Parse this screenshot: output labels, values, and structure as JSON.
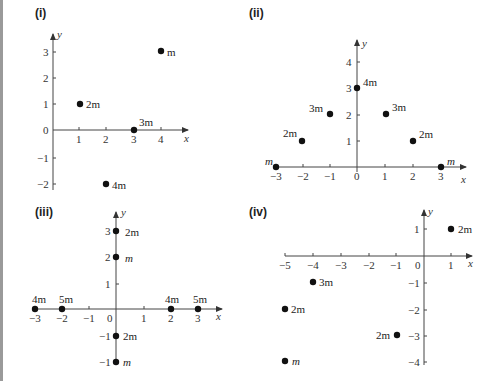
{
  "panels": [
    {
      "label": "(i)",
      "x_axis": "x",
      "y_axis": "y",
      "x_ticks": [
        "1",
        "2",
        "3",
        "4"
      ],
      "y_ticks": [
        "3",
        "2",
        "1",
        "0",
        "−1",
        "−2"
      ],
      "points": [
        {
          "x": 4,
          "y": 3,
          "mass": "m"
        },
        {
          "x": 1,
          "y": 1,
          "mass": "2m"
        },
        {
          "x": 3,
          "y": 0,
          "mass": "3m"
        },
        {
          "x": 2,
          "y": -2,
          "mass": "4m"
        }
      ]
    },
    {
      "label": "(ii)",
      "x_axis": "x",
      "y_axis": "y",
      "x_ticks": [
        "−3",
        "−2",
        "−1",
        "0",
        "1",
        "2",
        "3"
      ],
      "y_ticks": [
        "4",
        "3",
        "2",
        "1"
      ],
      "points": [
        {
          "x": -3,
          "y": 0,
          "mass": "m"
        },
        {
          "x": -2,
          "y": 1,
          "mass": "2m"
        },
        {
          "x": -1,
          "y": 2,
          "mass": "3m"
        },
        {
          "x": 0,
          "y": 3,
          "mass": "4m"
        },
        {
          "x": 1,
          "y": 2,
          "mass": "3m"
        },
        {
          "x": 2,
          "y": 1,
          "mass": "2m"
        },
        {
          "x": 3,
          "y": 0,
          "mass": "m"
        }
      ]
    },
    {
      "label": "(iii)",
      "x_axis": "x",
      "y_axis": "y",
      "x_ticks": [
        "−3",
        "−2",
        "−1",
        "0",
        "1",
        "2",
        "3"
      ],
      "y_ticks": [
        "3",
        "2",
        "1",
        "−1",
        "−1"
      ],
      "points": [
        {
          "x": 0,
          "y": 3,
          "mass": "2m"
        },
        {
          "x": 0,
          "y": 2,
          "mass": "m"
        },
        {
          "x": -3,
          "y": 0,
          "mass": "4m"
        },
        {
          "x": -2,
          "y": 0,
          "mass": "5m"
        },
        {
          "x": 2,
          "y": 0,
          "mass": "4m"
        },
        {
          "x": 3,
          "y": 0,
          "mass": "5m"
        },
        {
          "x": 0,
          "y": -1,
          "mass": "2m"
        },
        {
          "x": 0,
          "y": -2,
          "mass": "m"
        }
      ]
    },
    {
      "label": "(iv)",
      "x_axis": "x",
      "y_axis": "y",
      "x_ticks": [
        "−5",
        "−4",
        "−3",
        "−2",
        "−1",
        "0",
        "1"
      ],
      "y_ticks": [
        "1",
        "−1",
        "−2",
        "−3",
        "−4"
      ],
      "points": [
        {
          "x": 1,
          "y": 1,
          "mass": "2m"
        },
        {
          "x": -4,
          "y": -1,
          "mass": "3m"
        },
        {
          "x": -5,
          "y": -2,
          "mass": "2m"
        },
        {
          "x": -1,
          "y": -3,
          "mass": "2m"
        },
        {
          "x": -5,
          "y": -4,
          "mass": "m"
        }
      ]
    }
  ]
}
